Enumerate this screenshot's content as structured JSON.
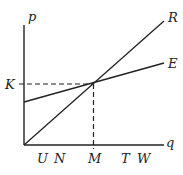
{
  "diagram": {
    "axes": {
      "y_label": "p",
      "x_label": "q",
      "origin": [
        24,
        145
      ],
      "y_top": 25,
      "x_right": 164
    },
    "lines": [
      {
        "name": "R",
        "label": "R",
        "from": [
          24,
          145
        ],
        "to": [
          164,
          21
        ]
      },
      {
        "name": "E",
        "label": "E",
        "from": [
          24,
          102
        ],
        "to": [
          164,
          63
        ]
      }
    ],
    "intersection": {
      "x": 93.5,
      "y": 84,
      "x_label": "M",
      "y_label": "K"
    },
    "x_tick_labels": [
      "U",
      "N",
      "M",
      "T",
      "W"
    ],
    "y_tick_labels": [
      "K"
    ],
    "colors": {
      "line": "#222222",
      "background": "#ffffff"
    }
  },
  "labels": {
    "p": "p",
    "q": "q",
    "R": "R",
    "E": "E",
    "K": "K",
    "U": "U",
    "N": "N",
    "M": "M",
    "T": "T",
    "W": "W"
  }
}
